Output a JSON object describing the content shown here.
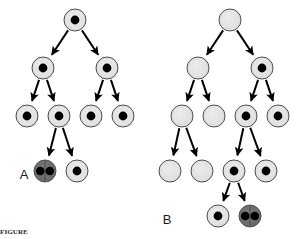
{
  "figure": {
    "background_color": "#ffffff",
    "width": 301,
    "height": 239
  },
  "style": {
    "cell_fill_light": "#e2e2e2",
    "cell_fill_dark": "#6e6e6e",
    "cell_stroke": "#3a3a3a",
    "nucleus_fill": "#000000",
    "arrow_color": "#000000",
    "label_color": "#1a1a1a",
    "cell_radius": 11,
    "nucleus_radius": 4
  },
  "legend": {
    "plain_cell": "undifferentiated cell (no nucleus shown)",
    "nucleated_cell": "cell with nucleus",
    "dividing_cell": "dividing cell with two nuclei"
  },
  "panels": [
    {
      "id": "A",
      "label": "A",
      "label_x": 24,
      "label_y": 179,
      "nodes": [
        {
          "id": "a-r1-n1",
          "name": "root-cell",
          "x": 75,
          "y": 20,
          "type": "nucleated"
        },
        {
          "id": "a-r2-n1",
          "name": "generation2-left",
          "x": 43,
          "y": 68,
          "type": "nucleated"
        },
        {
          "id": "a-r2-n2",
          "name": "generation2-right",
          "x": 107,
          "y": 68,
          "type": "nucleated"
        },
        {
          "id": "a-r3-n1",
          "name": "generation3-1",
          "x": 27,
          "y": 116,
          "type": "nucleated"
        },
        {
          "id": "a-r3-n2",
          "name": "generation3-2",
          "x": 59,
          "y": 116,
          "type": "nucleated"
        },
        {
          "id": "a-r3-n3",
          "name": "generation3-3",
          "x": 91,
          "y": 116,
          "type": "nucleated"
        },
        {
          "id": "a-r3-n4",
          "name": "generation3-4",
          "x": 123,
          "y": 116,
          "type": "nucleated"
        },
        {
          "id": "a-r4-n1",
          "name": "generation4-dividing",
          "x": 45,
          "y": 171,
          "type": "dividing"
        },
        {
          "id": "a-r4-n2",
          "name": "generation4-2",
          "x": 77,
          "y": 171,
          "type": "nucleated"
        }
      ],
      "edges": [
        {
          "from": "a-r1-n1",
          "to": "a-r2-n1"
        },
        {
          "from": "a-r1-n1",
          "to": "a-r2-n2"
        },
        {
          "from": "a-r2-n1",
          "to": "a-r3-n1"
        },
        {
          "from": "a-r2-n1",
          "to": "a-r3-n2"
        },
        {
          "from": "a-r2-n2",
          "to": "a-r3-n3"
        },
        {
          "from": "a-r2-n2",
          "to": "a-r3-n4"
        },
        {
          "from": "a-r3-n2",
          "to": "a-r4-n1"
        },
        {
          "from": "a-r3-n2",
          "to": "a-r4-n2"
        }
      ]
    },
    {
      "id": "B",
      "label": "B",
      "label_x": 167,
      "label_y": 224,
      "nodes": [
        {
          "id": "b-r1-n1",
          "name": "root-cell",
          "x": 230,
          "y": 20,
          "type": "plain"
        },
        {
          "id": "b-r2-n1",
          "name": "generation2-left",
          "x": 198,
          "y": 68,
          "type": "plain"
        },
        {
          "id": "b-r2-n2",
          "name": "generation2-right",
          "x": 262,
          "y": 68,
          "type": "nucleated"
        },
        {
          "id": "b-r3-n1",
          "name": "generation3-1",
          "x": 182,
          "y": 116,
          "type": "plain"
        },
        {
          "id": "b-r3-n2",
          "name": "generation3-2",
          "x": 214,
          "y": 116,
          "type": "plain"
        },
        {
          "id": "b-r3-n3",
          "name": "generation3-3",
          "x": 246,
          "y": 116,
          "type": "nucleated"
        },
        {
          "id": "b-r3-n4",
          "name": "generation3-4",
          "x": 278,
          "y": 116,
          "type": "nucleated"
        },
        {
          "id": "b-r4-n1",
          "name": "generation4-1",
          "x": 170,
          "y": 171,
          "type": "plain"
        },
        {
          "id": "b-r4-n2",
          "name": "generation4-2",
          "x": 202,
          "y": 171,
          "type": "plain"
        },
        {
          "id": "b-r4-n3",
          "name": "generation4-3",
          "x": 234,
          "y": 171,
          "type": "nucleated"
        },
        {
          "id": "b-r4-n4",
          "name": "generation4-4",
          "x": 266,
          "y": 171,
          "type": "nucleated"
        },
        {
          "id": "b-r5-n1",
          "name": "generation5-1",
          "x": 218,
          "y": 216,
          "type": "nucleated"
        },
        {
          "id": "b-r5-n2",
          "name": "generation5-dividing",
          "x": 250,
          "y": 216,
          "type": "dividing"
        }
      ],
      "edges": [
        {
          "from": "b-r1-n1",
          "to": "b-r2-n1"
        },
        {
          "from": "b-r1-n1",
          "to": "b-r2-n2"
        },
        {
          "from": "b-r2-n1",
          "to": "b-r3-n1"
        },
        {
          "from": "b-r2-n1",
          "to": "b-r3-n2"
        },
        {
          "from": "b-r2-n2",
          "to": "b-r3-n3"
        },
        {
          "from": "b-r2-n2",
          "to": "b-r3-n4"
        },
        {
          "from": "b-r3-n1",
          "to": "b-r4-n1"
        },
        {
          "from": "b-r3-n1",
          "to": "b-r4-n2"
        },
        {
          "from": "b-r3-n3",
          "to": "b-r4-n3"
        },
        {
          "from": "b-r3-n3",
          "to": "b-r4-n4"
        },
        {
          "from": "b-r4-n3",
          "to": "b-r5-n1"
        },
        {
          "from": "b-r4-n3",
          "to": "b-r5-n2"
        }
      ]
    }
  ],
  "caption": {
    "visible": true,
    "text": "FIGURE"
  }
}
